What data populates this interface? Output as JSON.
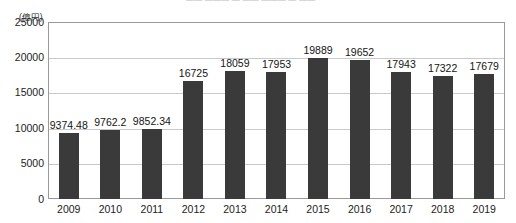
{
  "chart_data": {
    "type": "bar",
    "title": "",
    "title_sliver_text": "—— ——— — —— ——— — ——",
    "xlabel": "",
    "ylabel": "(億円)",
    "categories": [
      "2009",
      "2010",
      "2011",
      "2012",
      "2013",
      "2014",
      "2015",
      "2016",
      "2017",
      "2018",
      "2019"
    ],
    "values": [
      9374.48,
      9762.2,
      9852.34,
      16725,
      18059,
      17953,
      19889,
      19652,
      17943,
      17322,
      17679
    ],
    "value_labels": [
      "9374.48",
      "9762.2",
      "9852.34",
      "16725",
      "18059",
      "17953",
      "19889",
      "19652",
      "17943",
      "17322",
      "17679"
    ],
    "ylim": [
      0,
      25000
    ],
    "ytick_labels": [
      "25000",
      "20000",
      "15000",
      "10000",
      "5000",
      "0"
    ],
    "ytick_values": [
      25000,
      20000,
      15000,
      10000,
      5000,
      0
    ],
    "grid": "horizontal",
    "legend": "none",
    "bar_color": "#3a3a3a",
    "gridline_color": "#c9c9c9",
    "frame_color": "#9a9a9a",
    "background_color": "#ffffff"
  }
}
